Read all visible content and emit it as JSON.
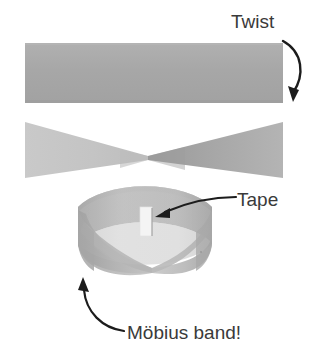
{
  "figure": {
    "title_alt": "Möbius band construction",
    "background_color": "#ffffff",
    "width": 330,
    "height": 364
  },
  "labels": {
    "twist": "Twist",
    "tape": "Tape",
    "mobius": "Möbius band!"
  },
  "annotations": {
    "twist_arrow": "curved-arrow-down",
    "tape_arrow": "curved-arrow-left",
    "mobius_arrow": "curved-arrow-up-left"
  },
  "colors": {
    "paper_gray": "#a9a9a9",
    "paper_gray_light": "#c2c2c2",
    "paper_gray_dark": "#9a9a9a",
    "band_light": "#c6c6c6",
    "band_mid": "#b0b0b0",
    "band_dark": "#9c9c9c",
    "tape_white": "#f2f2f2",
    "ink": "#3a3a3a",
    "arrow": "#1c1c1c"
  },
  "steps": {
    "flat_strip": "flat paper strip",
    "twisted_strip": "strip with a half twist",
    "taped_band": "ends taped into a Möbius band"
  }
}
